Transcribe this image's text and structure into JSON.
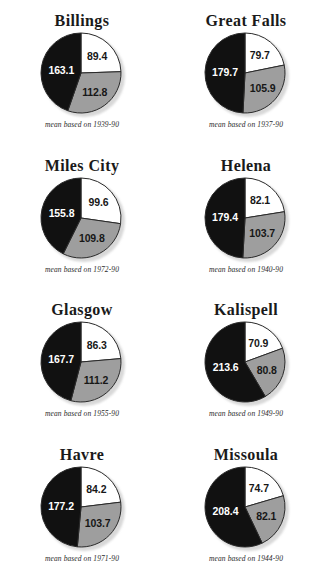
{
  "figure": {
    "top_fragment": "",
    "palette": {
      "slice_light": "#ffffff",
      "slice_mid": "#9e9e9e",
      "slice_dark": "#111111",
      "outline": "#2a2a2a",
      "title_color": "#1a1a1a",
      "caption_color": "#2b2b2b"
    }
  },
  "chart_data": [
    {
      "type": "pie",
      "title": "Billings",
      "caption": "mean based on 1939-90",
      "categories": [
        "light",
        "mid",
        "dark"
      ],
      "values": [
        89.4,
        112.8,
        163.1
      ],
      "labels": [
        "89.4",
        "112.8",
        "163.1"
      ],
      "total": 365.3,
      "start_angle": 0,
      "legend": "none"
    },
    {
      "type": "pie",
      "title": "Great Falls",
      "caption": "mean based on 1937-90",
      "categories": [
        "light",
        "mid",
        "dark"
      ],
      "values": [
        79.7,
        105.9,
        179.7
      ],
      "labels": [
        "79.7",
        "105.9",
        "179.7"
      ],
      "total": 365.3,
      "start_angle": 0,
      "legend": "none"
    },
    {
      "type": "pie",
      "title": "Miles City",
      "caption": "mean based on 1972-90",
      "categories": [
        "light",
        "mid",
        "dark"
      ],
      "values": [
        99.6,
        109.8,
        155.8
      ],
      "labels": [
        "99.6",
        "109.8",
        "155.8"
      ],
      "total": 365.2,
      "start_angle": 0,
      "legend": "none"
    },
    {
      "type": "pie",
      "title": "Helena",
      "caption": "mean based on 1940-90",
      "categories": [
        "light",
        "mid",
        "dark"
      ],
      "values": [
        82.1,
        103.7,
        179.4
      ],
      "labels": [
        "82.1",
        "103.7",
        "179.4"
      ],
      "total": 365.2,
      "start_angle": 0,
      "legend": "none"
    },
    {
      "type": "pie",
      "title": "Glasgow",
      "caption": "mean based on 1955-90",
      "categories": [
        "light",
        "mid",
        "dark"
      ],
      "values": [
        86.3,
        111.2,
        167.7
      ],
      "labels": [
        "86.3",
        "111.2",
        "167.7"
      ],
      "total": 365.2,
      "start_angle": 0,
      "legend": "none"
    },
    {
      "type": "pie",
      "title": "Kalispell",
      "caption": "mean based on 1949-90",
      "categories": [
        "light",
        "mid",
        "dark"
      ],
      "values": [
        70.9,
        80.8,
        213.6
      ],
      "labels": [
        "70.9",
        "80.8",
        "213.6"
      ],
      "total": 365.3,
      "start_angle": 0,
      "legend": "none"
    },
    {
      "type": "pie",
      "title": "Havre",
      "caption": "mean based on 1971-90",
      "categories": [
        "light",
        "mid",
        "dark"
      ],
      "values": [
        84.2,
        103.7,
        177.2
      ],
      "labels": [
        "84.2",
        "103.7",
        "177.2"
      ],
      "total": 365.1,
      "start_angle": 0,
      "legend": "none"
    },
    {
      "type": "pie",
      "title": "Missoula",
      "caption": "mean based on 1944-90",
      "categories": [
        "light",
        "mid",
        "dark"
      ],
      "values": [
        74.7,
        82.1,
        208.4
      ],
      "labels": [
        "74.7",
        "82.1",
        "208.4"
      ],
      "total": 365.2,
      "start_angle": 0,
      "legend": "none"
    }
  ]
}
